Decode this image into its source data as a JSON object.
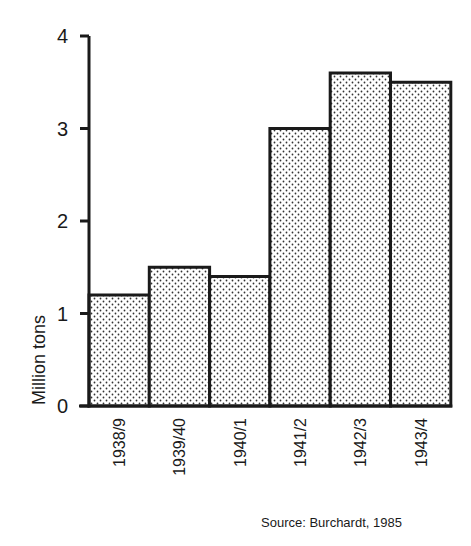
{
  "chart_data": {
    "type": "bar",
    "title": "",
    "xlabel": "",
    "ylabel": "Million tons",
    "categories": [
      "1938/9",
      "1939/40",
      "1940/1",
      "1941/2",
      "1942/3",
      "1943/4"
    ],
    "values": [
      1.2,
      1.5,
      1.4,
      3.0,
      3.6,
      3.5
    ],
    "ylim": [
      0,
      4
    ],
    "yticks": [
      0,
      1,
      2,
      3,
      4
    ],
    "grid": false,
    "legend": null,
    "bar_fill": "dotted stipple pattern",
    "annotations": [
      "Source: Burchardt, 1985"
    ]
  },
  "source_note": "Source: Burchardt, 1985",
  "colors": {
    "ink": "#1a1a1a",
    "background": "#ffffff",
    "dot": "#333333"
  }
}
